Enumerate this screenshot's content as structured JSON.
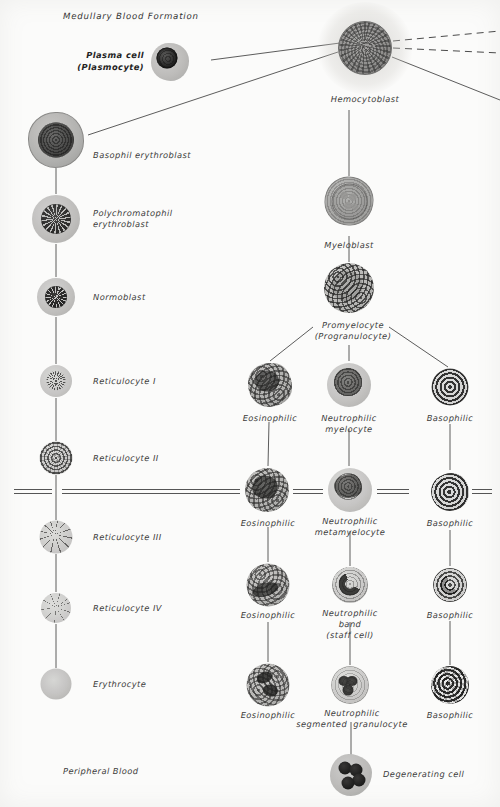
{
  "figure": {
    "title": "Medullary Blood Formation",
    "footer": "Peripheral Blood",
    "width": 500,
    "height": 807,
    "background": "#fbfbfa",
    "ink": "#4a4a4a"
  },
  "labels": {
    "plasma_cell_line1": "Plasma cell",
    "plasma_cell_line2": "(Plasmocyte)",
    "hemocytoblast": "Hemocytoblast",
    "basophil_erythroblast": "Basophil erythroblast",
    "polychromatophil_line1": "Polychromatophil",
    "polychromatophil_line2": "erythroblast",
    "normoblast": "Normoblast",
    "reticulocyte_1": "Reticulocyte I",
    "reticulocyte_2": "Reticulocyte II",
    "reticulocyte_3": "Reticulocyte III",
    "reticulocyte_4": "Reticulocyte IV",
    "erythrocyte": "Erythrocyte",
    "myeloblast": "Myeloblast",
    "promyelocyte_line1": "Promyelocyte",
    "promyelocyte_line2": "(Progranulocyte)",
    "eosinophilic": "Eosinophilic",
    "basophilic": "Basophilic",
    "neutrophilic": "Neutrophilic",
    "myelocyte": "myelocyte",
    "metamyelocyte": "metamyelocyte",
    "band": "band",
    "staff_cell": "(staff cell)",
    "segmented_granulocyte": "segmented  granulocyte",
    "degenerating_cell": "Degenerating cell"
  },
  "cells": [
    {
      "id": "plasma-cell",
      "name": "plasma-cell",
      "x": 170,
      "y": 62,
      "d": 38
    },
    {
      "id": "hemocytoblast",
      "name": "hemocytoblast",
      "x": 365,
      "y": 48,
      "d": 52
    },
    {
      "id": "basophil-erythroblast",
      "name": "basophil-erythroblast",
      "x": 56,
      "y": 140,
      "d": 54
    },
    {
      "id": "polychromatophil-erythroblast",
      "name": "polychromatophil-erythroblast",
      "x": 56,
      "y": 219,
      "d": 48
    },
    {
      "id": "normoblast",
      "name": "normoblast",
      "x": 56,
      "y": 297,
      "d": 38
    },
    {
      "id": "reticulocyte-1",
      "name": "reticulocyte-i",
      "x": 56,
      "y": 381,
      "d": 32
    },
    {
      "id": "reticulocyte-2",
      "name": "reticulocyte-ii",
      "x": 56,
      "y": 458,
      "d": 33
    },
    {
      "id": "reticulocyte-3",
      "name": "reticulocyte-iii",
      "x": 56,
      "y": 537,
      "d": 33
    },
    {
      "id": "reticulocyte-4",
      "name": "reticulocyte-iv",
      "x": 56,
      "y": 608,
      "d": 30
    },
    {
      "id": "erythrocyte",
      "name": "erythrocyte",
      "x": 56,
      "y": 684,
      "d": 31
    },
    {
      "id": "myeloblast",
      "name": "myeloblast",
      "x": 349,
      "y": 201,
      "d": 47
    },
    {
      "id": "promyelocyte",
      "name": "promyelocyte",
      "x": 349,
      "y": 288,
      "d": 50
    },
    {
      "id": "eos-myelocyte",
      "name": "eosinophilic-myelocyte",
      "x": 270,
      "y": 385,
      "d": 44
    },
    {
      "id": "neu-myelocyte",
      "name": "neutrophilic-myelocyte",
      "x": 349,
      "y": 385,
      "d": 44
    },
    {
      "id": "bas-myelocyte",
      "name": "basophilic-myelocyte",
      "x": 450,
      "y": 387,
      "d": 37
    },
    {
      "id": "eos-metamyelocyte",
      "name": "eosinophilic-metamyelocyte",
      "x": 267,
      "y": 490,
      "d": 44
    },
    {
      "id": "neu-metamyelocyte",
      "name": "neutrophilic-metamyelocyte",
      "x": 350,
      "y": 490,
      "d": 44
    },
    {
      "id": "bas-metamyelocyte",
      "name": "basophilic-metamyelocyte",
      "x": 450,
      "y": 492,
      "d": 38
    },
    {
      "id": "eos-band",
      "name": "eosinophilic-band",
      "x": 268,
      "y": 585,
      "d": 43
    },
    {
      "id": "neu-band",
      "name": "neutrophilic-band",
      "x": 350,
      "y": 585,
      "d": 36
    },
    {
      "id": "bas-band",
      "name": "basophilic-band",
      "x": 450,
      "y": 585,
      "d": 34
    },
    {
      "id": "eos-segmented",
      "name": "eosinophilic-segmented",
      "x": 268,
      "y": 685,
      "d": 43
    },
    {
      "id": "neu-segmented",
      "name": "neutrophilic-segmented",
      "x": 350,
      "y": 685,
      "d": 38
    },
    {
      "id": "bas-segmented",
      "name": "basophilic-segmented",
      "x": 450,
      "y": 685,
      "d": 38
    },
    {
      "id": "degenerating-cell",
      "name": "degenerating-cell",
      "x": 351,
      "y": 775,
      "d": 42
    }
  ]
}
